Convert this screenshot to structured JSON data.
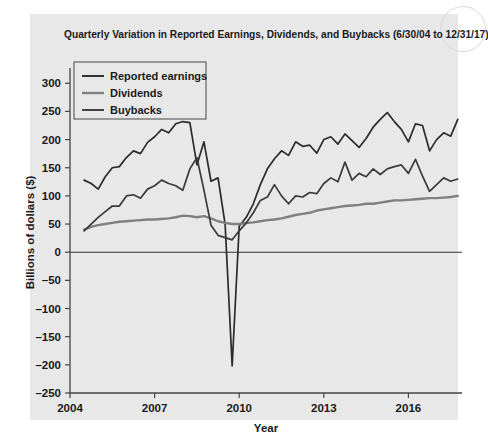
{
  "figure": {
    "title": "Quarterly Variation in Reported Earnings, Dividends, and Buybacks (6/30/04 to 12/31/17)",
    "background": "#e8e8e8",
    "page_background": "#ffffff"
  },
  "legend": {
    "position": "top-left-inside",
    "entries": [
      {
        "label": "Reported earnings",
        "color": "#2b2b2b"
      },
      {
        "label": "Dividends",
        "color": "#7f7f7f"
      },
      {
        "label": "Buybacks",
        "color": "#3a3a3a"
      }
    ]
  },
  "chart_data": {
    "type": "line",
    "title": "Quarterly Variation in Reported Earnings, Dividends, and Buybacks (6/30/04 to 12/31/17)",
    "xlabel": "Year",
    "ylabel": "Billions of dollars ($)",
    "xlim": [
      2004.0,
      2017.9
    ],
    "ylim": [
      -250,
      320
    ],
    "ytick_values": [
      300,
      250,
      200,
      150,
      100,
      50,
      0,
      -50,
      -100,
      -150,
      -200,
      -250
    ],
    "ytick_labels": [
      "300",
      "250",
      "200",
      "150",
      "100",
      "50",
      "0",
      "–50",
      "–100",
      "–150",
      "–200",
      "–250"
    ],
    "xtick_values": [
      2004,
      2007,
      2010,
      2013,
      2016
    ],
    "xtick_labels": [
      "2004",
      "2007",
      "2010",
      "2013",
      "2016"
    ],
    "grid": false,
    "zero_line": true,
    "x": [
      2004.5,
      2004.75,
      2005.0,
      2005.25,
      2005.5,
      2005.75,
      2006.0,
      2006.25,
      2006.5,
      2006.75,
      2007.0,
      2007.25,
      2007.5,
      2007.75,
      2008.0,
      2008.25,
      2008.5,
      2008.75,
      2009.0,
      2009.25,
      2009.5,
      2009.75,
      2010.0,
      2010.25,
      2010.5,
      2010.75,
      2011.0,
      2011.25,
      2011.5,
      2011.75,
      2012.0,
      2012.25,
      2012.5,
      2012.75,
      2013.0,
      2013.25,
      2013.5,
      2013.75,
      2014.0,
      2014.25,
      2014.5,
      2014.75,
      2015.0,
      2015.25,
      2015.5,
      2015.75,
      2016.0,
      2016.25,
      2016.5,
      2016.75,
      2017.0,
      2017.25,
      2017.5,
      2017.75
    ],
    "series": [
      {
        "name": "Reported earnings",
        "color": "#2b2b2b",
        "values": [
          128,
          122,
          112,
          134,
          150,
          152,
          168,
          180,
          175,
          195,
          205,
          218,
          212,
          228,
          232,
          230,
          155,
          196,
          126,
          132,
          50,
          -202,
          46,
          62,
          86,
          120,
          148,
          166,
          180,
          172,
          196,
          188,
          190,
          176,
          200,
          205,
          192,
          210,
          198,
          186,
          202,
          222,
          236,
          248,
          232,
          218,
          196,
          228,
          225,
          180,
          200,
          212,
          206,
          236
        ]
      },
      {
        "name": "Dividends",
        "color": "#7f7f7f",
        "values": [
          40,
          45,
          48,
          50,
          52,
          54,
          55,
          56,
          57,
          58,
          58,
          59,
          60,
          62,
          65,
          64,
          62,
          64,
          60,
          55,
          52,
          50,
          50,
          52,
          53,
          55,
          57,
          58,
          60,
          63,
          66,
          68,
          70,
          74,
          76,
          78,
          80,
          82,
          83,
          84,
          86,
          86,
          88,
          90,
          92,
          92,
          93,
          94,
          95,
          96,
          96,
          97,
          98,
          100
        ]
      },
      {
        "name": "Buybacks",
        "color": "#3a3a3a",
        "values": [
          38,
          50,
          62,
          72,
          82,
          82,
          100,
          102,
          96,
          112,
          118,
          128,
          122,
          118,
          110,
          148,
          168,
          110,
          48,
          30,
          26,
          22,
          38,
          52,
          70,
          92,
          98,
          120,
          100,
          86,
          100,
          98,
          106,
          104,
          122,
          132,
          125,
          160,
          128,
          140,
          134,
          148,
          138,
          148,
          152,
          155,
          140,
          165,
          135,
          108,
          120,
          132,
          126,
          130
        ]
      }
    ]
  }
}
